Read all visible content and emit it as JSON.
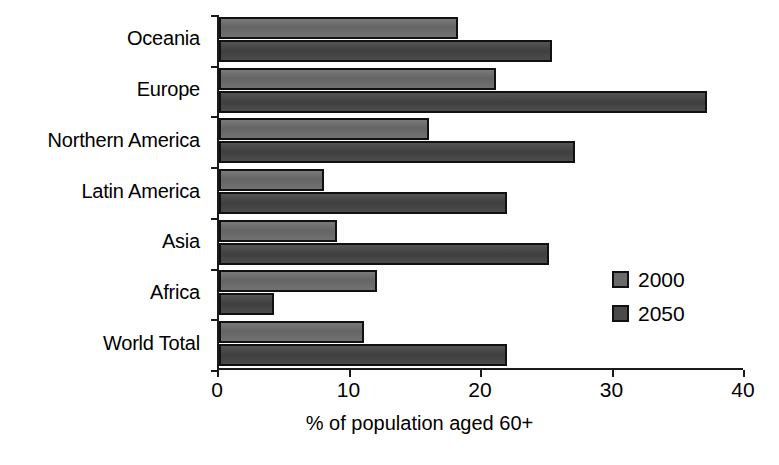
{
  "chart_data": {
    "type": "bar",
    "orientation": "horizontal",
    "title": "",
    "xlabel": "% of population aged 60+",
    "ylabel": "",
    "xlim": [
      0,
      40
    ],
    "xticks": [
      0,
      10,
      20,
      30,
      40
    ],
    "xtick_labels": [
      "0",
      "10",
      "20",
      "30",
      "40"
    ],
    "grid": false,
    "legend_position": "right-inside",
    "categories": [
      "Oceania",
      "Europe",
      "Northern America",
      "Latin America",
      "Asia",
      "Africa",
      "World Total"
    ],
    "series": [
      {
        "name": "2000",
        "color": "#6a6a6a",
        "values": [
          18.2,
          21.1,
          16.0,
          8.0,
          9.0,
          12.0,
          11.0
        ]
      },
      {
        "name": "2050",
        "color": "#4a4a4a",
        "values": [
          25.3,
          37.1,
          27.1,
          21.9,
          25.1,
          4.2,
          21.9
        ]
      }
    ]
  },
  "legend": {
    "items": [
      {
        "label": "2000",
        "color": "#6a6a6a"
      },
      {
        "label": "2050",
        "color": "#4a4a4a"
      }
    ]
  }
}
